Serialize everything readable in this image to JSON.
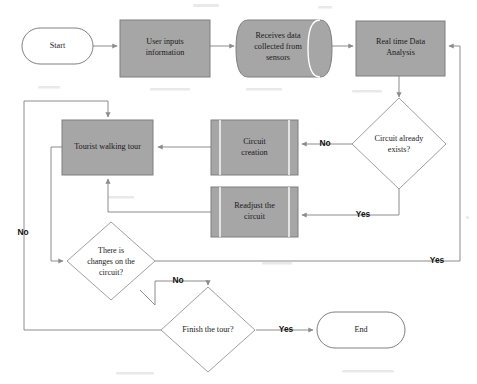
{
  "diagram": {
    "colors": {
      "process_fill": "#a6a6a6",
      "process_stroke": "#7f7f7f",
      "terminator_fill": "#ffffff",
      "terminator_stroke": "#808080",
      "decision_fill": "#ffffff",
      "decision_stroke": "#949494",
      "connector": "#8c8c8c",
      "text": "#1a1a1a",
      "background": "#ffffff"
    },
    "nodes": [
      {
        "id": "start",
        "shape": "terminator",
        "label": "Start"
      },
      {
        "id": "user_inputs",
        "shape": "process",
        "label": "User inputs information",
        "line1": "User inputs",
        "line2": "information"
      },
      {
        "id": "receives_data",
        "shape": "cylinder",
        "label": "Receives data collected from sensors",
        "line1": "Receives data",
        "line2": "collected from",
        "line3": "sensors"
      },
      {
        "id": "realtime",
        "shape": "process",
        "label": "Real time Data Analysis",
        "line1": "Real time Data",
        "line2": "Analysis"
      },
      {
        "id": "circuit_exists",
        "shape": "decision",
        "label": "Circuit already exists?",
        "line1": "Circuit already",
        "line2": "exists?"
      },
      {
        "id": "circuit_create",
        "shape": "predefined-process",
        "label": "Circuit creation",
        "line1": "Circuit",
        "line2": "creation"
      },
      {
        "id": "readjust",
        "shape": "predefined-process",
        "label": "Readjust the circuit",
        "line1": "Readjust the",
        "line2": "circuit"
      },
      {
        "id": "walking_tour",
        "shape": "process",
        "label": "Tourist walking tour",
        "line1": "Tourist walking tour"
      },
      {
        "id": "changes",
        "shape": "decision",
        "label": "There is changes on the circuit?",
        "line1": "There is",
        "line2": "changes on the",
        "line3": "circuit?"
      },
      {
        "id": "finish",
        "shape": "decision",
        "label": "Finish the tour?",
        "line1": "Finish the tour?"
      },
      {
        "id": "end",
        "shape": "terminator",
        "label": "End"
      }
    ],
    "edge_labels": {
      "exists_no": "No",
      "exists_yes": "Yes",
      "changes_yes": "Yes",
      "changes_no": "No",
      "finish_no": "No",
      "finish_yes": "Yes"
    },
    "edges": [
      {
        "from": "start",
        "to": "user_inputs",
        "label": ""
      },
      {
        "from": "user_inputs",
        "to": "receives_data",
        "label": ""
      },
      {
        "from": "receives_data",
        "to": "realtime",
        "label": ""
      },
      {
        "from": "realtime",
        "to": "circuit_exists",
        "label": ""
      },
      {
        "from": "circuit_exists",
        "to": "circuit_create",
        "label": "No"
      },
      {
        "from": "circuit_exists",
        "to": "readjust",
        "label": "Yes"
      },
      {
        "from": "circuit_create",
        "to": "walking_tour",
        "label": ""
      },
      {
        "from": "readjust",
        "to": "walking_tour",
        "label": ""
      },
      {
        "from": "walking_tour",
        "to": "changes",
        "label": ""
      },
      {
        "from": "changes",
        "to": "realtime",
        "label": "Yes"
      },
      {
        "from": "changes",
        "to": "finish",
        "label": "No"
      },
      {
        "from": "finish",
        "to": "walking_tour",
        "label": "No"
      },
      {
        "from": "finish",
        "to": "end",
        "label": "Yes"
      }
    ]
  }
}
